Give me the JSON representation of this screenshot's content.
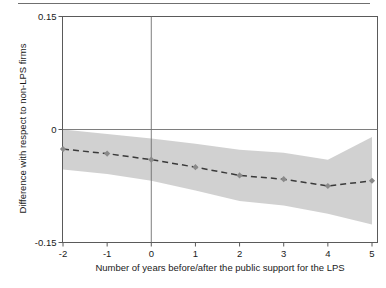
{
  "figure": {
    "background_color": "#ffffff",
    "frame_color": "#5a5a5a",
    "top_rule_color": "#6f6f6f"
  },
  "chart_data": {
    "type": "line",
    "title": "",
    "subtitle": "",
    "xlabel": "Number of years before/after the public support for the LPS",
    "ylabel": "Difference with respect to non-LPS firms",
    "xlim": [
      -2,
      5
    ],
    "ylim": [
      -0.15,
      0.15
    ],
    "xticks": [
      -2,
      -1,
      0,
      1,
      2,
      3,
      4,
      5
    ],
    "xticklabels": [
      "-2",
      "-1",
      "0",
      "1",
      "2",
      "3",
      "4",
      "5"
    ],
    "yticks": [
      0.15,
      0,
      -0.15
    ],
    "yticklabels": [
      "0.15",
      "0",
      "-0.15"
    ],
    "grid": false,
    "legend": null,
    "x": [
      -2,
      -1,
      0,
      1,
      2,
      3,
      4,
      5
    ],
    "series": [
      {
        "name": "Difference with respect to non-LPS firms",
        "style": "dashed",
        "color": "#3a3a3a",
        "marker": "diamond",
        "marker_color": "#8a8a8a",
        "values": [
          -0.026,
          -0.032,
          -0.04,
          -0.05,
          -0.061,
          -0.066,
          -0.075,
          -0.068
        ]
      }
    ],
    "confidence_band": {
      "name": "confidence interval",
      "fill_color": "#c9c9c9",
      "opacity": 0.85,
      "upper": [
        0.0,
        -0.006,
        -0.012,
        -0.019,
        -0.027,
        -0.031,
        -0.04,
        -0.01
      ],
      "lower": [
        -0.053,
        -0.059,
        -0.068,
        -0.081,
        -0.095,
        -0.101,
        -0.112,
        -0.126
      ]
    },
    "reference_lines": [
      {
        "name": "zero-horizontal-line",
        "orientation": "horizontal",
        "value": 0,
        "color": "#6f6f6f"
      },
      {
        "name": "event-vertical-line",
        "orientation": "vertical",
        "value": 0,
        "color": "#6f6f6f"
      }
    ]
  }
}
